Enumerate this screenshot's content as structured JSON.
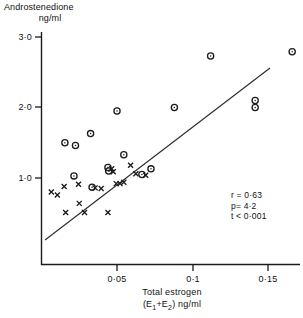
{
  "chart_data": {
    "type": "scatter",
    "title": "",
    "ylabel": "Androstenedione",
    "ylabel_units": "ng/ml",
    "xlabel_line1": "Total   estrogen",
    "xlabel_line2_prefix": "(E",
    "xlabel_line2_sub1": "1",
    "xlabel_line2_mid": "+E",
    "xlabel_line2_sub2": "2",
    "xlabel_line2_suffix": ")  ng/ml",
    "xticks": [
      "0·05",
      "0·1",
      "0·15"
    ],
    "xtick_values": [
      0.05,
      0.1,
      0.15
    ],
    "yticks": [
      "3·0",
      "2·0",
      "1·0"
    ],
    "ytick_values": [
      3.0,
      2.0,
      1.0
    ],
    "xlim": [
      0.001,
      0.174
    ],
    "ylim": [
      0.22,
      3.07
    ],
    "grid": false,
    "legend": "none",
    "series": [
      {
        "name": "open-circle-group",
        "marker": "open-circle",
        "points": [
          [
            0.0155,
            1.5
          ],
          [
            0.0225,
            1.46
          ],
          [
            0.0215,
            1.03
          ],
          [
            0.0325,
            1.63
          ],
          [
            0.0335,
            0.87
          ],
          [
            0.044,
            1.15
          ],
          [
            0.0445,
            1.1
          ],
          [
            0.05,
            1.95
          ],
          [
            0.0545,
            1.33
          ],
          [
            0.0665,
            1.05
          ],
          [
            0.0725,
            1.13
          ],
          [
            0.088,
            2.0
          ],
          [
            0.112,
            2.73
          ],
          [
            0.1415,
            2.1
          ],
          [
            0.1415,
            2.0
          ],
          [
            0.166,
            2.79
          ]
        ]
      },
      {
        "name": "cross-group",
        "marker": "cross",
        "points": [
          [
            0.0065,
            0.8
          ],
          [
            0.0105,
            0.76
          ],
          [
            0.015,
            0.88
          ],
          [
            0.016,
            0.51
          ],
          [
            0.0245,
            0.91
          ],
          [
            0.025,
            0.64
          ],
          [
            0.0285,
            0.51
          ],
          [
            0.0355,
            0.86
          ],
          [
            0.0395,
            0.85
          ],
          [
            0.044,
            0.51
          ],
          [
            0.0465,
            1.13
          ],
          [
            0.0475,
            1.09
          ],
          [
            0.0495,
            0.92
          ],
          [
            0.052,
            0.92
          ],
          [
            0.0545,
            0.94
          ],
          [
            0.059,
            1.18
          ],
          [
            0.0625,
            1.06
          ],
          [
            0.069,
            1.04
          ]
        ]
      }
    ],
    "regression_line": {
      "x_start": 0.0026,
      "y_start": 0.43,
      "x_end": 0.1515,
      "y_end": 2.56
    },
    "annotations": {
      "r_label": "r = 0·63",
      "p_label": "p= 4·2",
      "t_label": "t < 0·001"
    }
  }
}
